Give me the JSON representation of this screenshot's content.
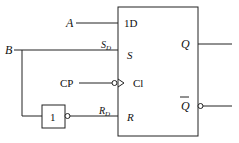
{
  "diagram": {
    "type": "D flip-flop with asynchronous set/reset",
    "inputs": {
      "A": "A",
      "B": "B",
      "CP": "CP"
    },
    "pins": {
      "d": "1D",
      "s": "S",
      "cl": "Cl",
      "r": "R",
      "q": "Q",
      "qbar": "Q"
    },
    "wire_labels": {
      "sd_main": "S",
      "sd_sub": "D",
      "rd_main": "R",
      "rd_sub": "D"
    },
    "not_gate": {
      "label": "1"
    }
  }
}
